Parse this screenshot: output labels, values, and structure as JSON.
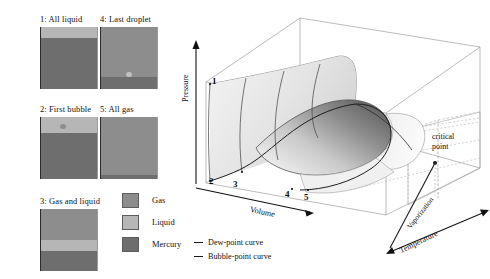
{
  "figure": {
    "type": "pvt-surface-diagram",
    "tubes": [
      {
        "id": "tube-1",
        "caption": "1: All liquid",
        "contents": [
          {
            "material": "liquid",
            "fraction": 0.17
          },
          {
            "material": "mercury",
            "fraction": 0.83
          }
        ],
        "marker": null
      },
      {
        "id": "tube-2",
        "caption": "2: First bubble",
        "contents": [
          {
            "material": "liquid",
            "fraction": 0.26
          },
          {
            "material": "mercury",
            "fraction": 0.74
          }
        ],
        "marker": "bubble"
      },
      {
        "id": "tube-3",
        "caption": "3: Gas and liquid",
        "contents": [
          {
            "material": "gas",
            "fraction": 0.5
          },
          {
            "material": "liquid",
            "fraction": 0.17
          },
          {
            "material": "mercury",
            "fraction": 0.33
          }
        ],
        "marker": null
      },
      {
        "id": "tube-4",
        "caption": "4: Last droplet",
        "contents": [
          {
            "material": "gas",
            "fraction": 0.8
          },
          {
            "material": "mercury",
            "fraction": 0.2
          }
        ],
        "marker": "droplet"
      },
      {
        "id": "tube-5",
        "caption": "5: All gas",
        "contents": [
          {
            "material": "gas",
            "fraction": 0.93
          },
          {
            "material": "mercury",
            "fraction": 0.07
          }
        ],
        "marker": null
      }
    ],
    "material_legend": [
      {
        "label": "Gas",
        "color": "#8d8d8d"
      },
      {
        "label": "Liquid",
        "color": "#b6b6b6"
      },
      {
        "label": "Mercury",
        "color": "#6e6e6e"
      }
    ],
    "curve_legend": [
      {
        "label": "Dew-point curve",
        "color": "#1a1a1a"
      },
      {
        "label": "Bubble-point curve",
        "color": "#1a1a1a"
      }
    ],
    "axes": {
      "pressure": "Pressure",
      "volume": "Volume",
      "temperature": "Temperature"
    },
    "annotations": {
      "critical_point_line1": "critical",
      "critical_point_line2": "point",
      "vaporization": "Vaporization"
    },
    "state_points": [
      {
        "label": "1",
        "x": 31,
        "y": 80
      },
      {
        "label": "2",
        "x": 35,
        "y": 178
      },
      {
        "label": "3",
        "x": 54,
        "y": 182
      },
      {
        "label": "4",
        "x": 98,
        "y": 195
      },
      {
        "label": "5",
        "x": 115,
        "y": 196
      }
    ]
  }
}
